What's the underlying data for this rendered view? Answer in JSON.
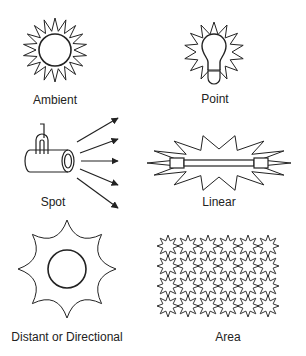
{
  "diagram": {
    "items": [
      {
        "id": "ambient",
        "label": "Ambient",
        "icon": "sun-icon"
      },
      {
        "id": "point",
        "label": "Point",
        "icon": "lightbulb-icon"
      },
      {
        "id": "spot",
        "label": "Spot",
        "icon": "spotlight-icon"
      },
      {
        "id": "linear",
        "label": "Linear",
        "icon": "tube-light-icon"
      },
      {
        "id": "directional",
        "label": "Distant or Directional",
        "icon": "star-sun-icon"
      },
      {
        "id": "area",
        "label": "Area",
        "icon": "star-grid-icon"
      }
    ],
    "colors": {
      "stroke": "#222222",
      "background": "#ffffff"
    }
  }
}
